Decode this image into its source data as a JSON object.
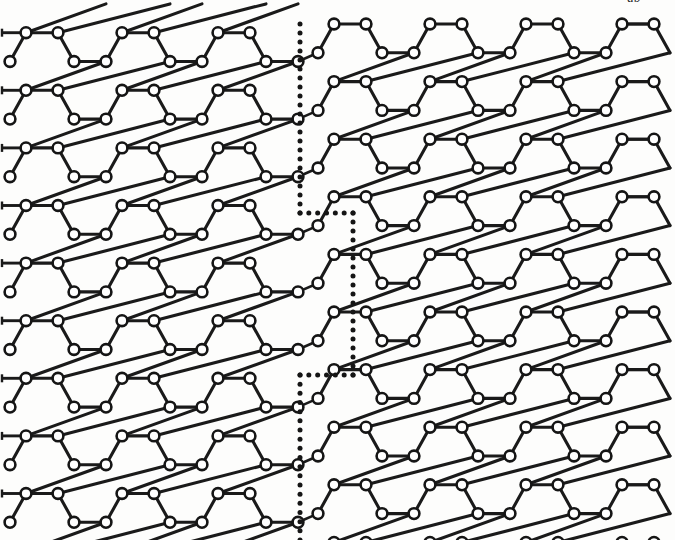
{
  "figure": {
    "kind": "lattice-diagram",
    "background_color": "#fdfdfc",
    "bond_color": "#1a1a1a",
    "atom_fill_color": "#ffffff",
    "atom_stroke_color": "#151515",
    "boundary_color": "#151515",
    "top_cropped_label": "ab"
  },
  "lattice": {
    "bond_length_px": 32,
    "row_spacing_px": 28.8,
    "cell_width_px": 96,
    "cell_height_px": 57.6,
    "atom_radius_px": 5.4,
    "left_grain": {
      "name": "left-grain",
      "origin_x": 26,
      "origin_y": 32.7,
      "columns": 4,
      "rows": 10,
      "row_y_values": [
        32.7,
        61.7,
        90.7,
        119.3,
        148.3,
        176.7,
        205.7,
        235.0,
        263.0,
        292.0
      ],
      "orientation_deg": 0
    },
    "right_grain": {
      "name": "right-grain",
      "origin_x": 334,
      "origin_y": 24.0,
      "columns": 4,
      "rows": 10,
      "row_y_values": [
        24.0,
        52.3,
        81.0,
        108.3,
        137.0,
        165.0,
        193.5,
        221.7,
        250.0,
        277.3
      ],
      "orientation_deg": 0,
      "vertical_offset_px": 20
    },
    "edge_stubs": {
      "left_edge_x": 26,
      "left_stub_end_x": 2,
      "right_edge_x": 622,
      "right_stub_end_x": 652,
      "left_stub_count": 9,
      "right_stub_count": 9
    }
  },
  "grain_boundary": {
    "name": "grain-boundary",
    "style": "dotted",
    "dot_radius_px": 2.5,
    "dot_spacing_px": 9.2,
    "segments": [
      {
        "name": "upper-vertical",
        "x1": 300,
        "y1": 24,
        "x2": 300,
        "y2": 213
      },
      {
        "name": "upper-jog-horizontal",
        "x1": 300,
        "y1": 213,
        "x2": 353,
        "y2": 213
      },
      {
        "name": "middle-vertical",
        "x1": 353,
        "y1": 213,
        "x2": 353,
        "y2": 375
      },
      {
        "name": "lower-jog-horizontal",
        "x1": 353,
        "y1": 375,
        "x2": 300,
        "y2": 375
      },
      {
        "name": "lower-vertical",
        "x1": 300,
        "y1": 375,
        "x2": 300,
        "y2": 540
      }
    ]
  }
}
